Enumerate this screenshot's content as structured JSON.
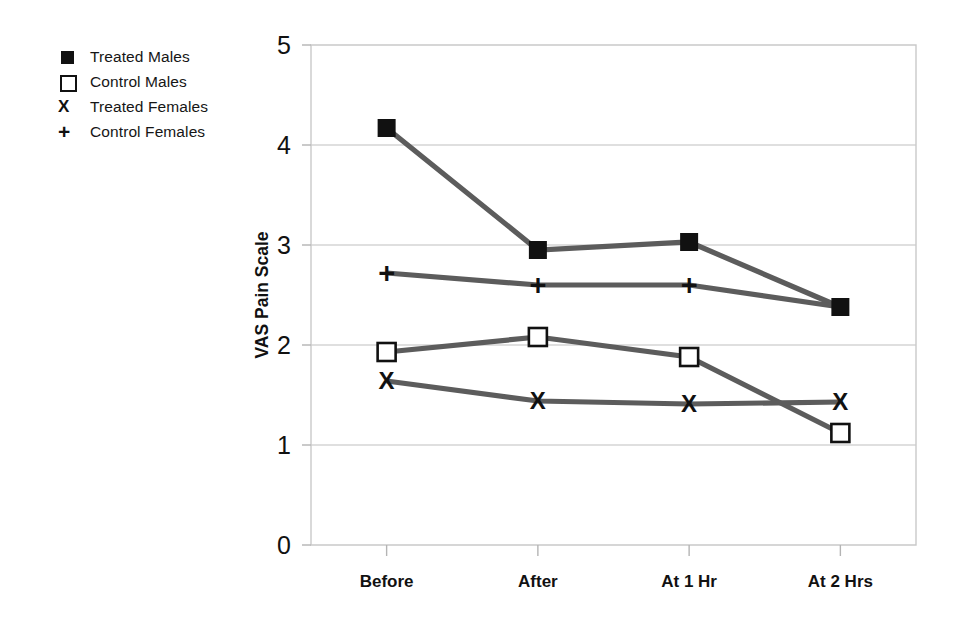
{
  "chart_data": {
    "type": "line",
    "title": "",
    "xlabel": "",
    "ylabel": "VAS Pain Scale",
    "categories": [
      "Before",
      "After",
      "At 1 Hr",
      "At 2 Hrs"
    ],
    "ylim": [
      0,
      5
    ],
    "yticks": [
      "0",
      "1",
      "2",
      "3",
      "4",
      "5"
    ],
    "grid": true,
    "legend_position": "upper-left-outside",
    "series": [
      {
        "name": "Treated Males",
        "marker": "filled-square",
        "marker_glyph": "■",
        "values": [
          4.17,
          2.95,
          3.03,
          2.38
        ]
      },
      {
        "name": "Control Males",
        "marker": "open-square",
        "marker_glyph": "□",
        "values": [
          1.93,
          2.08,
          1.88,
          1.12
        ]
      },
      {
        "name": "Treated Females",
        "marker": "x",
        "marker_glyph": "X",
        "values": [
          1.64,
          1.44,
          1.41,
          1.43
        ]
      },
      {
        "name": "Control Females",
        "marker": "plus",
        "marker_glyph": "+",
        "values": [
          2.72,
          2.6,
          2.6,
          2.38
        ]
      }
    ],
    "colors": {
      "line": "#5c5c5c",
      "marker": "#111111",
      "gridline": "#d4d4d4",
      "plot_border": "#c9c9c9",
      "background": "#ffffff",
      "text": "#111111"
    }
  },
  "legend": {
    "items": [
      {
        "label": "Treated Males",
        "marker": "filled-square"
      },
      {
        "label": "Control Males",
        "marker": "open-square"
      },
      {
        "label": "Treated Females",
        "marker": "x"
      },
      {
        "label": "Control Females",
        "marker": "plus"
      }
    ]
  }
}
